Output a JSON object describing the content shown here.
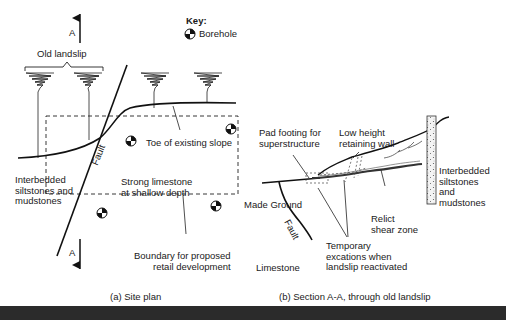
{
  "site_plan": {
    "section_marker": "A",
    "section_marker_bottom": "A",
    "key_title": "Key:",
    "key_item": "Borehole",
    "old_landslip": "Old landslip",
    "fault": "Fault",
    "toe_label": "Toe of existing slope",
    "left_geology": "Interbedded\nsiltstones and\nmudstones",
    "center_geology": "Strong limestone\nat shallow depth",
    "boundary_label": "Boundary for proposed\nretail development",
    "caption": "(a) Site plan"
  },
  "section": {
    "pad_footing": "Pad footing for\nsuperstructure",
    "retaining_wall": "Low height\nretaining wall",
    "made_ground": "Made Ground",
    "fault": "Fault",
    "limestone": "Limestone",
    "relict_shear": "Relict\nshear zone",
    "temporary": "Temporary\nexcations when\nlandslip reactivated",
    "right_geology": "Interbedded\nsiltstones\nand\nmudstones",
    "caption": "(b) Section A-A, through old landslip"
  }
}
